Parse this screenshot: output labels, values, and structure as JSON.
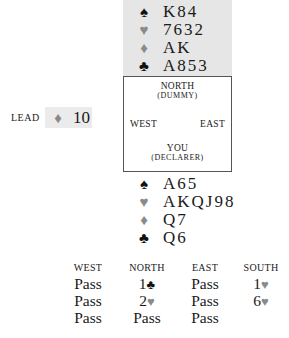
{
  "north": {
    "hand": [
      {
        "suit": "♠",
        "suit_name": "spades",
        "color": "black",
        "cards": "K84"
      },
      {
        "suit": "♥",
        "suit_name": "hearts",
        "color": "red",
        "cards": "7632"
      },
      {
        "suit": "♦",
        "suit_name": "diamonds",
        "color": "red",
        "cards": "AK"
      },
      {
        "suit": "♣",
        "suit_name": "clubs",
        "color": "black",
        "cards": "A853"
      }
    ]
  },
  "table": {
    "north_label": "NORTH",
    "north_sub": "(DUMMY)",
    "west_label": "WEST",
    "east_label": "EAST",
    "south_label": "YOU",
    "south_sub": "(DECLARER)"
  },
  "lead": {
    "label": "LEAD",
    "suit": "♦",
    "suit_name": "diamonds",
    "card": "10"
  },
  "south": {
    "hand": [
      {
        "suit": "♠",
        "suit_name": "spades",
        "color": "black",
        "cards": "A65"
      },
      {
        "suit": "♥",
        "suit_name": "hearts",
        "color": "red",
        "cards": "AKQJ98"
      },
      {
        "suit": "♦",
        "suit_name": "diamonds",
        "color": "red",
        "cards": "Q7"
      },
      {
        "suit": "♣",
        "suit_name": "clubs",
        "color": "black",
        "cards": "Q6"
      }
    ]
  },
  "auction": {
    "headers": [
      "WEST",
      "NORTH",
      "EAST",
      "SOUTH"
    ],
    "rounds": [
      [
        {
          "text": "Pass"
        },
        {
          "level": "1",
          "suit": "♣",
          "color": "black"
        },
        {
          "text": "Pass"
        },
        {
          "level": "1",
          "suit": "♥",
          "color": "red"
        }
      ],
      [
        {
          "text": "Pass"
        },
        {
          "level": "2",
          "suit": "♥",
          "color": "red"
        },
        {
          "text": "Pass"
        },
        {
          "level": "6",
          "suit": "♥",
          "color": "red"
        }
      ],
      [
        {
          "text": "Pass"
        },
        {
          "text": "Pass"
        },
        {
          "text": "Pass"
        },
        null
      ]
    ]
  },
  "colors": {
    "dummy_background": "#e6e6e6",
    "lead_background": "#ebebeb",
    "red_suit": "#8a8a8a",
    "black_suit": "#111111"
  }
}
